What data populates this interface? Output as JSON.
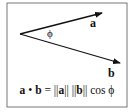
{
  "diagram": {
    "vectors": [
      {
        "name": "a",
        "label": "a"
      },
      {
        "name": "b",
        "label": "b"
      }
    ],
    "angle_label": "ϕ",
    "formula": {
      "lhs_a": "a",
      "op": "•",
      "lhs_b": "b",
      "eq": "=",
      "norm_open_a": "||",
      "norm_a": "a",
      "norm_close_a": "||",
      "norm_open_b": "||",
      "norm_b": "b",
      "norm_close_b": "||",
      "func": "cos",
      "angle": "ϕ"
    },
    "colors": {
      "stroke": "#111111",
      "border": "#666666",
      "background": "#ffffff"
    }
  }
}
